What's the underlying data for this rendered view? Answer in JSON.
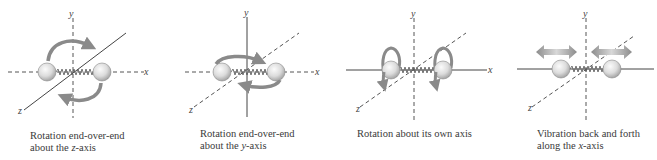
{
  "figure": {
    "colors": {
      "axis": "#555555",
      "arrow": "#8a8a8a",
      "ball_light": "#f4f4f4",
      "ball_dark": "#a8a8a8",
      "spring": "#555555",
      "caption": "#3a3a3a"
    },
    "panels": [
      {
        "id": "z-rotation",
        "axes": {
          "x": "x",
          "y": "y",
          "z": "z"
        },
        "solid_axis": "z",
        "motion": "curved rotation arrows in the x-y plane about the z-axis",
        "caption_line1": "Rotation end-over-end",
        "caption_line2_prefix": "about the ",
        "caption_line2_var": "z",
        "caption_line2_suffix": "-axis"
      },
      {
        "id": "y-rotation",
        "axes": {
          "x": "x",
          "y": "y",
          "z": "z"
        },
        "solid_axis": "y",
        "motion": "flat elliptical rotation arrows about the y-axis",
        "caption_line1": "Rotation end-over-end",
        "caption_line2_prefix": "about the ",
        "caption_line2_var": "y",
        "caption_line2_suffix": "-axis"
      },
      {
        "id": "own-axis-rotation",
        "axes": {
          "x": "x",
          "y": "y",
          "z": "z"
        },
        "solid_axis": "x",
        "motion": "loop arrows around each sphere about the molecular (x) axis",
        "caption_line1": "Rotation about its own axis"
      },
      {
        "id": "x-vibration",
        "axes": {
          "x": "x",
          "y": "y",
          "z": "z"
        },
        "solid_axis": "x",
        "motion": "double-headed arrows above each sphere along the x-axis",
        "caption_line1": "Vibration back and forth",
        "caption_line2_prefix": "along the ",
        "caption_line2_var": "x",
        "caption_line2_suffix": "-axis"
      }
    ]
  }
}
